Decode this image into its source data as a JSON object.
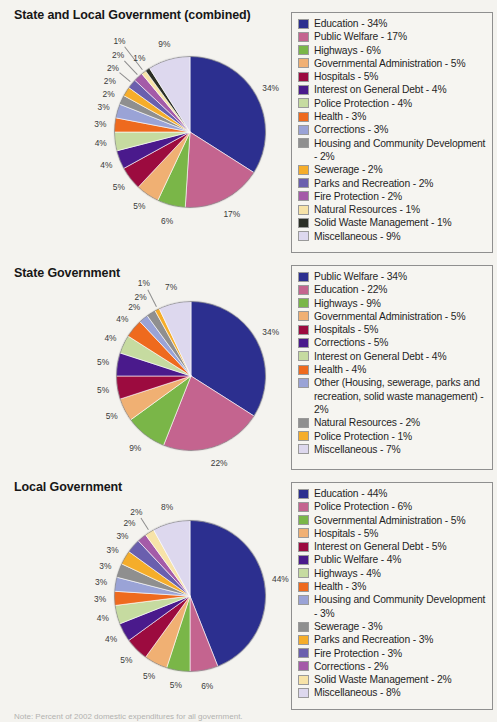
{
  "document": {
    "background_color": "#f4f3ef",
    "footnote": "Note: Percent of 2002 domestic expenditures for all government."
  },
  "palette": {
    "education_blue": "#2c2f8f",
    "public_welfare_pink": "#c4648f",
    "highways_green": "#7ab648",
    "gov_admin_peach": "#f0b073",
    "hospitals_maroon": "#9c0b3f",
    "interest_purple": "#4a1a8c",
    "police_lightgreen": "#c6dba0",
    "health_orange": "#ee6a1e",
    "corrections_periwinkle": "#9aa3d6",
    "housing_gray": "#8f8f8f",
    "sewerage_amber": "#f5ad2a",
    "parks_violet": "#6a5fae",
    "fire_magenta": "#a45ba8",
    "natural_cream": "#f7e3a8",
    "solid_waste_dark": "#2b2f26",
    "misc_lavender": "#ddd8ee"
  },
  "charts": [
    {
      "id": "state-and-local-combined",
      "title": "State and Local Government (combined)",
      "chart_data": {
        "type": "pie",
        "title": "State and Local Government (combined)",
        "legend_position": "right",
        "categories": [
          "Education",
          "Public Welfare",
          "Highways",
          "Governmental Administration",
          "Hospitals",
          "Interest on General Debt",
          "Police Protection",
          "Health",
          "Corrections",
          "Housing and Community Development",
          "Sewerage",
          "Parks and Recreation",
          "Fire Protection",
          "Natural Resources",
          "Solid Waste Management",
          "Miscellaneous"
        ],
        "values": [
          34,
          17,
          6,
          5,
          5,
          4,
          4,
          3,
          3,
          2,
          2,
          2,
          2,
          1,
          1,
          9
        ],
        "colors": [
          "#2c2f8f",
          "#c4648f",
          "#7ab648",
          "#f0b073",
          "#9c0b3f",
          "#4a1a8c",
          "#c6dba0",
          "#ee6a1e",
          "#9aa3d6",
          "#8f8f8f",
          "#f5ad2a",
          "#6a5fae",
          "#a45ba8",
          "#f7e3a8",
          "#2b2f26",
          "#ddd8ee"
        ]
      },
      "legend": [
        {
          "label": "Education - 34%",
          "color": "#2c2f8f"
        },
        {
          "label": "Public Welfare - 17%",
          "color": "#c4648f"
        },
        {
          "label": "Highways - 6%",
          "color": "#7ab648"
        },
        {
          "label": "Governmental Administration - 5%",
          "color": "#f0b073"
        },
        {
          "label": "Hospitals - 5%",
          "color": "#9c0b3f"
        },
        {
          "label": "Interest on General Debt - 4%",
          "color": "#4a1a8c"
        },
        {
          "label": "Police Protection - 4%",
          "color": "#c6dba0"
        },
        {
          "label": "Health - 3%",
          "color": "#ee6a1e"
        },
        {
          "label": "Corrections - 3%",
          "color": "#9aa3d6"
        },
        {
          "label": "Housing and Community Development - 2%",
          "color": "#8f8f8f"
        },
        {
          "label": "Sewerage - 2%",
          "color": "#f5ad2a"
        },
        {
          "label": "Parks and Recreation - 2%",
          "color": "#6a5fae"
        },
        {
          "label": "Fire Protection - 2%",
          "color": "#a45ba8"
        },
        {
          "label": "Natural Resources - 1%",
          "color": "#f7e3a8"
        },
        {
          "label": "Solid Waste Management - 1%",
          "color": "#2b2f26"
        },
        {
          "label": "Miscellaneous - 9%",
          "color": "#ddd8ee"
        }
      ]
    },
    {
      "id": "state-government",
      "title": "State Government",
      "chart_data": {
        "type": "pie",
        "title": "State Government",
        "legend_position": "right",
        "categories": [
          "Public Welfare",
          "Education",
          "Highways",
          "Governmental Administration",
          "Hospitals",
          "Corrections",
          "Interest on General Debt",
          "Health",
          "Other (Housing, sewerage, parks and recreation, solid waste management)",
          "Natural Resources",
          "Police Protection",
          "Miscellaneous"
        ],
        "values": [
          34,
          22,
          9,
          5,
          5,
          5,
          4,
          4,
          2,
          2,
          1,
          7
        ],
        "colors": [
          "#2c2f8f",
          "#c4648f",
          "#7ab648",
          "#f0b073",
          "#9c0b3f",
          "#4a1a8c",
          "#c6dba0",
          "#ee6a1e",
          "#9aa3d6",
          "#8f8f8f",
          "#f5ad2a",
          "#ddd8ee"
        ]
      },
      "legend": [
        {
          "label": "Public Welfare - 34%",
          "color": "#2c2f8f"
        },
        {
          "label": "Education - 22%",
          "color": "#c4648f"
        },
        {
          "label": "Highways - 9%",
          "color": "#7ab648"
        },
        {
          "label": "Governmental Administration - 5%",
          "color": "#f0b073"
        },
        {
          "label": "Hospitals - 5%",
          "color": "#9c0b3f"
        },
        {
          "label": "Corrections - 5%",
          "color": "#4a1a8c"
        },
        {
          "label": "Interest on General Debt - 4%",
          "color": "#c6dba0"
        },
        {
          "label": "Health - 4%",
          "color": "#ee6a1e"
        },
        {
          "label": "Other (Housing, sewerage, parks and recreation, solid waste management) - 2%",
          "color": "#9aa3d6"
        },
        {
          "label": "Natural Resources - 2%",
          "color": "#8f8f8f"
        },
        {
          "label": "Police Protection - 1%",
          "color": "#f5ad2a"
        },
        {
          "label": "Miscellaneous - 7%",
          "color": "#ddd8ee"
        }
      ]
    },
    {
      "id": "local-government",
      "title": "Local Government",
      "chart_data": {
        "type": "pie",
        "title": "Local Government",
        "legend_position": "right",
        "categories": [
          "Education",
          "Police Protection",
          "Governmental Administration",
          "Hospitals",
          "Interest on General Debt",
          "Public Welfare",
          "Highways",
          "Health",
          "Housing and Community Development",
          "Sewerage",
          "Parks and Recreation",
          "Fire Protection",
          "Corrections",
          "Solid Waste Management",
          "Miscellaneous"
        ],
        "values": [
          44,
          6,
          5,
          5,
          5,
          4,
          4,
          3,
          3,
          3,
          3,
          3,
          2,
          2,
          8
        ],
        "colors": [
          "#2c2f8f",
          "#c4648f",
          "#7ab648",
          "#f0b073",
          "#9c0b3f",
          "#4a1a8c",
          "#c6dba0",
          "#ee6a1e",
          "#9aa3d6",
          "#8f8f8f",
          "#f5ad2a",
          "#6a5fae",
          "#a45ba8",
          "#f7e3a8",
          "#ddd8ee"
        ]
      },
      "legend": [
        {
          "label": "Education - 44%",
          "color": "#2c2f8f"
        },
        {
          "label": "Police Protection - 6%",
          "color": "#c4648f"
        },
        {
          "label": "Governmental Administration - 5%",
          "color": "#7ab648"
        },
        {
          "label": "Hospitals - 5%",
          "color": "#f0b073"
        },
        {
          "label": "Interest on General Debt - 5%",
          "color": "#9c0b3f"
        },
        {
          "label": "Public Welfare - 4%",
          "color": "#4a1a8c"
        },
        {
          "label": "Highways - 4%",
          "color": "#c6dba0"
        },
        {
          "label": "Health - 3%",
          "color": "#ee6a1e"
        },
        {
          "label": "Housing and Community Development - 3%",
          "color": "#9aa3d6"
        },
        {
          "label": "Sewerage - 3%",
          "color": "#8f8f8f"
        },
        {
          "label": "Parks and Recreation - 3%",
          "color": "#f5ad2a"
        },
        {
          "label": "Fire Protection - 3%",
          "color": "#6a5fae"
        },
        {
          "label": "Corrections - 2%",
          "color": "#a45ba8"
        },
        {
          "label": "Solid Waste Management - 2%",
          "color": "#f7e3a8"
        },
        {
          "label": "Miscellaneous - 8%",
          "color": "#ddd8ee"
        }
      ]
    }
  ]
}
